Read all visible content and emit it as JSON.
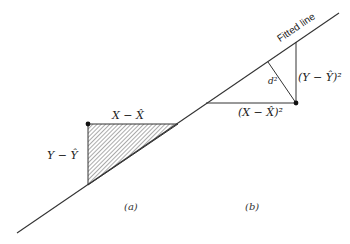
{
  "diagram": {
    "fitted_line_label": "Fitted line",
    "panel_a": {
      "caption": "(a)",
      "horizontal_label": "X − X̂",
      "vertical_label": "Y − Ŷ"
    },
    "panel_b": {
      "caption": "(b)",
      "horizontal_label": "(X − X̂)²",
      "vertical_label": "(Y − Ŷ)²",
      "perpendicular_label": "d²"
    },
    "colors": {
      "line": "#333333",
      "hatch": "#444444"
    }
  }
}
